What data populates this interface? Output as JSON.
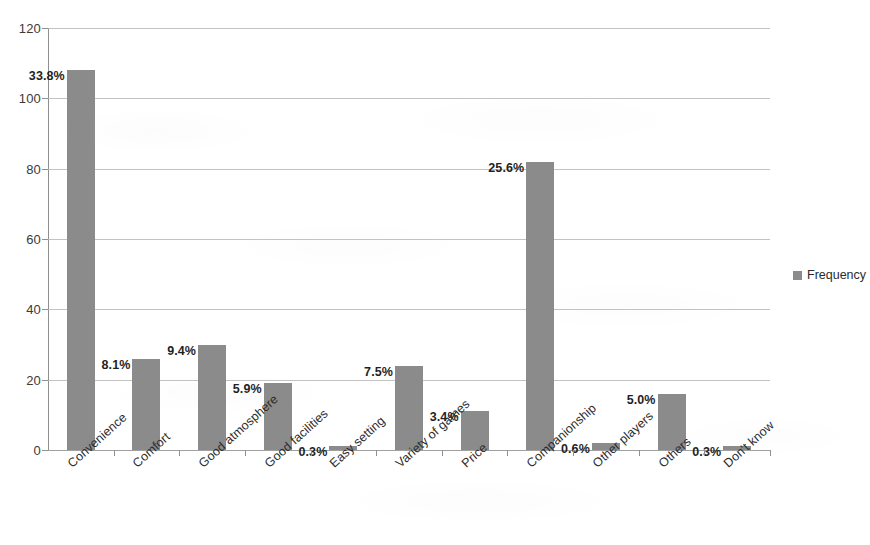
{
  "chart_data": {
    "type": "bar",
    "title": "",
    "subtitle": "",
    "xlabel": "",
    "ylabel": "",
    "ylim": [
      0,
      120
    ],
    "y_ticks": [
      0,
      20,
      40,
      60,
      80,
      100,
      120
    ],
    "grid": true,
    "legend_position": "right",
    "orientation": "vertical",
    "categories": [
      "Convenience",
      "Comfort",
      "Good atmosphere",
      "Good facilities",
      "Easy setting",
      "Variety of games",
      "Price",
      "Companionship",
      "Other players",
      "Others",
      "Don't know"
    ],
    "series": [
      {
        "name": "Frequency",
        "color": "#8b8b8b",
        "values": [
          108,
          26,
          30,
          19,
          1,
          24,
          11,
          82,
          2,
          16,
          1
        ],
        "data_labels": [
          "33.8%",
          "8.1%",
          "9.4%",
          "5.9%",
          "0.3%",
          "7.5%",
          "3.4%",
          "25.6%",
          "0.6%",
          "5.0%",
          "0.3%"
        ]
      }
    ],
    "legend": [
      {
        "label": "Frequency",
        "color": "#8b8b8b",
        "marker": "square"
      }
    ]
  },
  "axes": {
    "y_tick_labels": [
      "0",
      "20",
      "40",
      "60",
      "80",
      "100",
      "120"
    ]
  },
  "colors": {
    "bar": "#8b8b8b",
    "gridline": "#b9b9b9",
    "axis": "#8f8f8f",
    "text": "#2b2b2b",
    "background": "#ffffff"
  }
}
